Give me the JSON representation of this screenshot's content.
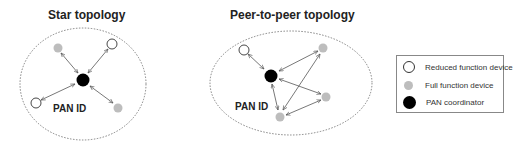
{
  "diagrams": [
    {
      "id": "star",
      "title": "Star topology",
      "network_label": "PAN ID",
      "nodes": [
        {
          "id": "c",
          "type": "PAN coordinator"
        },
        {
          "id": "n1",
          "type": "Full function device"
        },
        {
          "id": "n2",
          "type": "Reduced function device"
        },
        {
          "id": "n3",
          "type": "Reduced function device"
        },
        {
          "id": "n4",
          "type": "Full function device"
        }
      ],
      "links": [
        [
          "c",
          "n1"
        ],
        [
          "c",
          "n2"
        ],
        [
          "c",
          "n3"
        ],
        [
          "c",
          "n4"
        ]
      ]
    },
    {
      "id": "peer",
      "title": "Peer-to-peer topology",
      "network_label": "PAN ID",
      "nodes": [
        {
          "id": "c",
          "type": "PAN coordinator"
        },
        {
          "id": "r1",
          "type": "Reduced function device"
        },
        {
          "id": "f1",
          "type": "Full function device"
        },
        {
          "id": "f2",
          "type": "Full function device"
        },
        {
          "id": "f3",
          "type": "Full function device"
        }
      ],
      "links": [
        [
          "c",
          "r1"
        ],
        [
          "c",
          "f1"
        ],
        [
          "c",
          "f2"
        ],
        [
          "c",
          "f3"
        ],
        [
          "f1",
          "f3"
        ],
        [
          "f2",
          "f3"
        ]
      ]
    }
  ],
  "legend": {
    "items": [
      {
        "symbol": "white-circle",
        "label": "Reduced function device"
      },
      {
        "symbol": "gray-circle",
        "label": "Full function device"
      },
      {
        "symbol": "black-circle",
        "label": "PAN coordinator"
      }
    ]
  },
  "colors": {
    "reduced_function_device": "#ffffff",
    "full_function_device": "#bdbdbd",
    "pan_coordinator": "#000000",
    "ellipse_stroke": "#666666",
    "arrow": "#555555"
  }
}
